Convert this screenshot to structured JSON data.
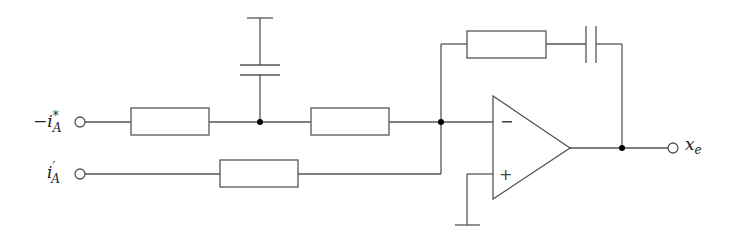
{
  "diagram": {
    "type": "circuit-schematic",
    "labels": {
      "input_1": "−i",
      "input_1_sup": "*",
      "input_1_sub": "A",
      "input_2": "i",
      "input_2_sup": "′",
      "input_2_sub": "A",
      "output": "x",
      "output_sub": "e",
      "minus_sign": "−",
      "plus_sign": "+"
    },
    "components": [
      {
        "id": "R1",
        "kind": "resistor",
        "position": "input 1 series"
      },
      {
        "id": "C1",
        "kind": "capacitor",
        "position": "shunt to ground (top)"
      },
      {
        "id": "R2",
        "kind": "resistor",
        "position": "input 1 series, after shunt"
      },
      {
        "id": "R3",
        "kind": "resistor",
        "position": "input 2 series"
      },
      {
        "id": "Rf",
        "kind": "resistor",
        "position": "feedback"
      },
      {
        "id": "Cf",
        "kind": "capacitor",
        "position": "feedback"
      },
      {
        "id": "U1",
        "kind": "op-amp",
        "position": "main amplifier"
      },
      {
        "id": "GND",
        "kind": "ground",
        "position": "non-inverting input"
      }
    ],
    "colors": {
      "wire": "#555555",
      "junction": "#000000",
      "text": "#222222"
    }
  }
}
